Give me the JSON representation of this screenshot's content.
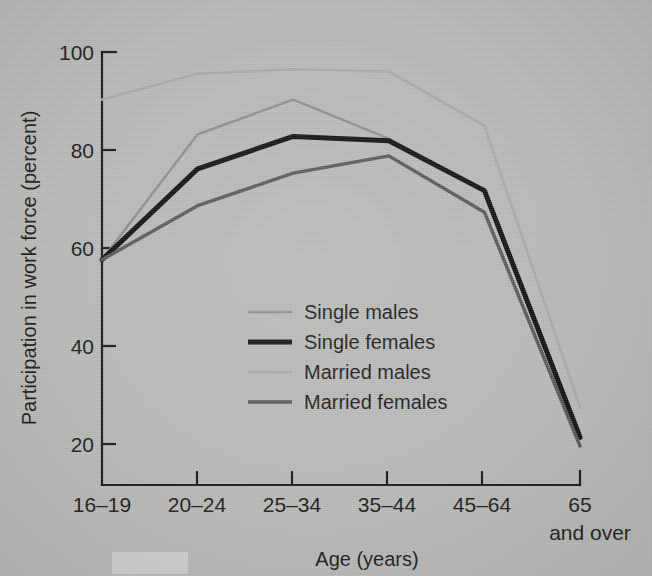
{
  "chart_data": {
    "type": "line",
    "title": "",
    "xlabel": "Age (years)",
    "ylabel": "Participation in work force (percent)",
    "categories": [
      "16–19",
      "20–24",
      "25–34",
      "35–44",
      "45–64",
      "65"
    ],
    "category_sublabels": [
      "",
      "",
      "",
      "",
      "",
      "and over"
    ],
    "xtick_labels": [
      "16–19",
      "20–24",
      "25–34",
      "35–44",
      "45–64",
      "65"
    ],
    "ytick_labels": [
      "100",
      "80",
      "60",
      "40",
      "20"
    ],
    "ytick_values": [
      100,
      80,
      60,
      40,
      20
    ],
    "ylim": [
      0,
      100
    ],
    "grid": false,
    "legend_position": "center",
    "series": [
      {
        "name": "Single males",
        "color": "#8e8e8e",
        "width": 2.4,
        "values": [
          52,
          81,
          89,
          80,
          68,
          12
        ]
      },
      {
        "name": "Single females",
        "color": "#121212",
        "width": 5.0,
        "values": [
          52,
          73,
          80.5,
          79.5,
          68,
          11
        ]
      },
      {
        "name": "Married males",
        "color": "#a9a9a9",
        "width": 2.6,
        "values": [
          89,
          95,
          96,
          95.5,
          83,
          18
        ]
      },
      {
        "name": "Married females",
        "color": "#5a5a5a",
        "width": 3.4,
        "values": [
          52,
          64.5,
          72,
          76,
          63,
          9
        ]
      }
    ]
  },
  "legend": {
    "items": [
      {
        "label": "Single males"
      },
      {
        "label": "Single females"
      },
      {
        "label": "Married males"
      },
      {
        "label": "Married females"
      }
    ]
  },
  "axes": {
    "y_title": "Participation in work force (percent)",
    "x_title": "Age (years)",
    "x_extra_label": "and over"
  }
}
